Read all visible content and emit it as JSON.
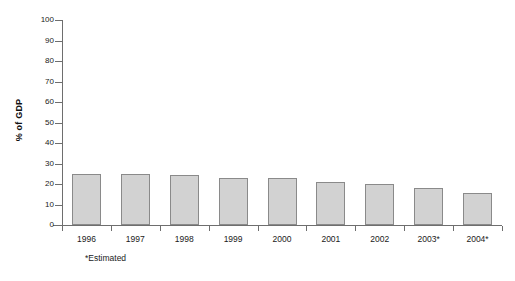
{
  "chart_data": {
    "type": "bar",
    "title": "",
    "subtitle": "",
    "xlabel": "",
    "ylabel": "% of GDP",
    "ylim": [
      0,
      100
    ],
    "ytick_step": 10,
    "yticks": [
      100,
      90,
      80,
      70,
      60,
      50,
      40,
      30,
      20,
      10,
      0
    ],
    "grid": false,
    "legend": false,
    "legend_position": "none",
    "categories": [
      "1996",
      "1997",
      "1998",
      "1999",
      "2000",
      "2001",
      "2002",
      "2003*",
      "2004*"
    ],
    "values": [
      25,
      25,
      24.5,
      23,
      23,
      21,
      20,
      18,
      15.5
    ],
    "series": [
      {
        "name": "% of GDP",
        "values": [
          25,
          25,
          24.5,
          23,
          23,
          21,
          20,
          18,
          15.5
        ]
      }
    ],
    "annotations": [
      "*Estimated"
    ],
    "bar_fill_color": "#d2d2d2",
    "bar_border_color": "#8a8a8a",
    "axis_color": "#6e6e6e",
    "background_color": "#ffffff"
  },
  "footnote": {
    "text": "*Estimated"
  }
}
